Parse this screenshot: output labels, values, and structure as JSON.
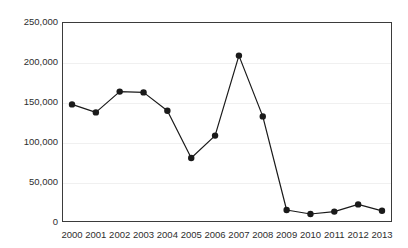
{
  "chart_data": {
    "type": "line",
    "title": "",
    "xlabel": "",
    "ylabel": "",
    "categories": [
      "2000",
      "2001",
      "2002",
      "2003",
      "2004",
      "2005",
      "2006",
      "2007",
      "2008",
      "2009",
      "2010",
      "2011",
      "2012",
      "2013"
    ],
    "values": [
      147000,
      137000,
      163000,
      162000,
      139000,
      80000,
      108000,
      208000,
      132000,
      15000,
      10000,
      13000,
      22000,
      14000
    ],
    "series": [
      {
        "name": "",
        "values": [
          147000,
          137000,
          163000,
          162000,
          139000,
          80000,
          108000,
          208000,
          132000,
          15000,
          10000,
          13000,
          22000,
          14000
        ]
      }
    ],
    "ylim": [
      0,
      250000
    ],
    "y_ticks": [
      0,
      50000,
      100000,
      150000,
      200000,
      250000
    ],
    "y_tick_labels": [
      "0",
      "50,000",
      "100,000",
      "150,000",
      "200,000",
      "250,000"
    ],
    "x_tick_labels": [
      "2000",
      "2001",
      "2002",
      "2003",
      "2004",
      "2005",
      "2006",
      "2007",
      "2008",
      "2009",
      "2010",
      "2011",
      "2012",
      "2013"
    ],
    "grid": true,
    "grid_axis": "y",
    "legend": false,
    "legend_position": "none",
    "marker": "circle",
    "line_color": "#1a1a1a",
    "marker_color": "#1a1a1a",
    "grid_color": "#f0f0f0",
    "axis_color": "#3b3b3b",
    "background_color": "#ffffff"
  }
}
